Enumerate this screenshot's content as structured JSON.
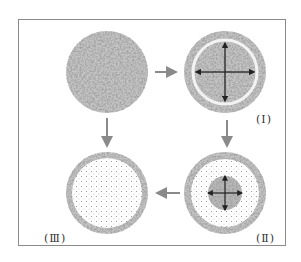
{
  "diagram": {
    "type": "process-cycle",
    "nodes": [
      {
        "id": "start",
        "label": "",
        "state": "fully grainy/dense texture"
      },
      {
        "id": "I",
        "label": "(Ⅰ)",
        "state": "outer grainy ring, light gap, dark core with large 4-way expansion arrows"
      },
      {
        "id": "II",
        "label": "(Ⅱ)",
        "state": "outer grainy ring, dotted middle zone, small dark core with small 4-way arrows"
      },
      {
        "id": "III",
        "label": "(Ⅲ)",
        "state": "outer grainy ring, fully dotted interior"
      }
    ],
    "edges": [
      {
        "from": "start",
        "to": "I",
        "direction": "right"
      },
      {
        "from": "start",
        "to": "III",
        "direction": "down"
      },
      {
        "from": "I",
        "to": "II",
        "direction": "down"
      },
      {
        "from": "II",
        "to": "III",
        "direction": "left"
      }
    ],
    "colors": {
      "frame": "#888888",
      "arrow": "#8a8a8a",
      "grain_dark": "#555555",
      "grain_light": "#bbbbbb",
      "dots": "#9a9a9a",
      "inner_arrow": "#222222"
    }
  }
}
